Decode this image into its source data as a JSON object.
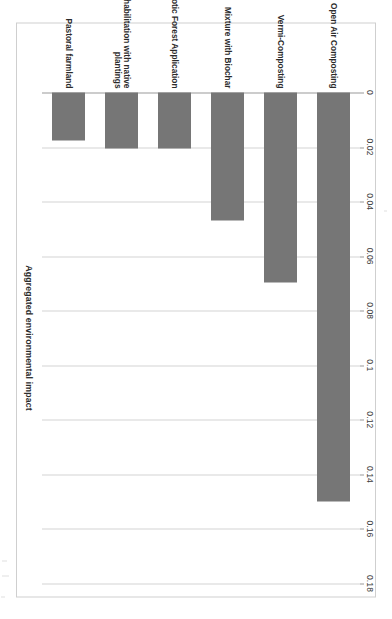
{
  "chart_data": {
    "type": "bar",
    "orientation": "horizontal",
    "title": "",
    "xlabel": "Aggregated environmental impact",
    "ylabel": "",
    "xlim": [
      0,
      0.18
    ],
    "grid": false,
    "legend": null,
    "tick_labels": [
      "0",
      "0.02",
      "0.04",
      "0.06",
      "0.08",
      "0.1",
      "0.12",
      "0.14",
      "0.16",
      "0.18"
    ],
    "tick_values": [
      0,
      0.02,
      0.04,
      0.06,
      0.08,
      0.1,
      0.12,
      0.14,
      0.16,
      0.18
    ],
    "categories": [
      "Open Air Composting",
      "Vermi-Composting",
      "Mixture with Biochar",
      "Exotic Forest Application",
      "Rehabilitation with native\nplantings",
      "Pastoral farmland"
    ],
    "values": [
      0.15,
      0.0695,
      0.047,
      0.0205,
      0.0205,
      0.0175
    ],
    "bar_color": "#767676",
    "axis_color": "#9a9a9a",
    "frame_color": "#cfcfcf",
    "background": "#ffffff"
  },
  "page": {
    "rotation_degrees": 90
  }
}
